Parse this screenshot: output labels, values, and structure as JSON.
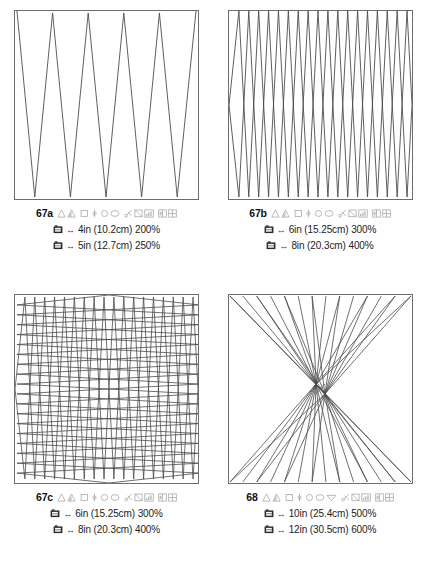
{
  "page": {
    "background_color": "#ffffff",
    "line_color": "#4a4a4a",
    "border_color": "#6d6d6d",
    "text_color": "#1a1a1a"
  },
  "panels": [
    {
      "id": "67a",
      "pattern_type": "zigzag",
      "pattern_description": "Single tall zigzag, 5 peaks",
      "peaks": 5,
      "icons": [
        "triangle-outline-icon",
        "triangle-shaded-icon",
        "square-outline-icon",
        "needle-icon",
        "circle-outline-icon",
        "oval-outline-icon",
        "scissors-icon",
        "flag-icon",
        "chart-bars-icon",
        "panel-split-icon",
        "grid-four-icon"
      ],
      "specs": [
        {
          "icon": "hoop-icon",
          "arrow": "↔",
          "inches": "4in",
          "metric": "(10.2cm)",
          "percent": "200%",
          "text": "4in (10.2cm) 200%"
        },
        {
          "icon": "hoop-icon",
          "arrow": "↔",
          "inches": "5in",
          "metric": "(12.7cm)",
          "percent": "250%",
          "text": "5in (12.7cm) 250%"
        }
      ]
    },
    {
      "id": "67b",
      "pattern_type": "diamond-lattice",
      "pattern_description": "Two interlocking zigzags forming diamonds, 9 peaks",
      "peaks": 9,
      "icons": [
        "triangle-outline-icon",
        "triangle-shaded-icon",
        "square-outline-icon",
        "needle-icon",
        "circle-outline-icon",
        "oval-outline-icon",
        "scissors-icon",
        "flag-icon",
        "chart-bars-icon",
        "panel-split-icon",
        "grid-four-icon"
      ],
      "specs": [
        {
          "icon": "hoop-icon",
          "arrow": "↔",
          "inches": "6in",
          "metric": "(15.25cm)",
          "percent": "300%",
          "text": "6in (15.25cm) 300%"
        },
        {
          "icon": "hoop-icon",
          "arrow": "↔",
          "inches": "8in",
          "metric": "(20.3cm)",
          "percent": "400%",
          "text": "8in (20.3cm) 400%"
        }
      ]
    },
    {
      "id": "67c",
      "pattern_type": "crosshatch-grid",
      "pattern_description": "Vertical and horizontal zigzags forming a woven grid",
      "peaks": 9,
      "icons": [
        "triangle-outline-icon",
        "triangle-shaded-icon",
        "square-outline-icon",
        "needle-icon",
        "circle-outline-icon",
        "oval-outline-icon",
        "scissors-icon",
        "flag-icon",
        "chart-bars-icon",
        "panel-split-icon",
        "grid-four-icon"
      ],
      "specs": [
        {
          "icon": "hoop-icon",
          "arrow": "↔",
          "inches": "6in",
          "metric": "(15.25cm)",
          "percent": "300%",
          "text": "6in (15.25cm) 300%"
        },
        {
          "icon": "hoop-icon",
          "arrow": "↔",
          "inches": "8in",
          "metric": "(20.3cm)",
          "percent": "400%",
          "text": "8in (20.3cm) 400%"
        }
      ]
    },
    {
      "id": "68",
      "pattern_type": "radial-hourglass",
      "pattern_description": "Rays converging to a central bowtie node",
      "rays": 15,
      "icons": [
        "triangle-outline-icon",
        "triangle-shaded-icon",
        "square-outline-icon",
        "needle-icon",
        "circle-outline-icon",
        "oval-outline-icon",
        "triangle-down-icon",
        "scissors-icon",
        "flag-icon",
        "chart-bars-icon",
        "panel-split-icon",
        "grid-four-icon"
      ],
      "specs": [
        {
          "icon": "hoop-icon",
          "arrow": "↔",
          "inches": "10in",
          "metric": "(25.4cm)",
          "percent": "500%",
          "text": "10in (25.4cm) 500%"
        },
        {
          "icon": "hoop-icon",
          "arrow": "↔",
          "inches": "12in",
          "metric": "(30.5cm)",
          "percent": "600%",
          "text": "12in (30.5cm) 600%"
        }
      ]
    }
  ]
}
